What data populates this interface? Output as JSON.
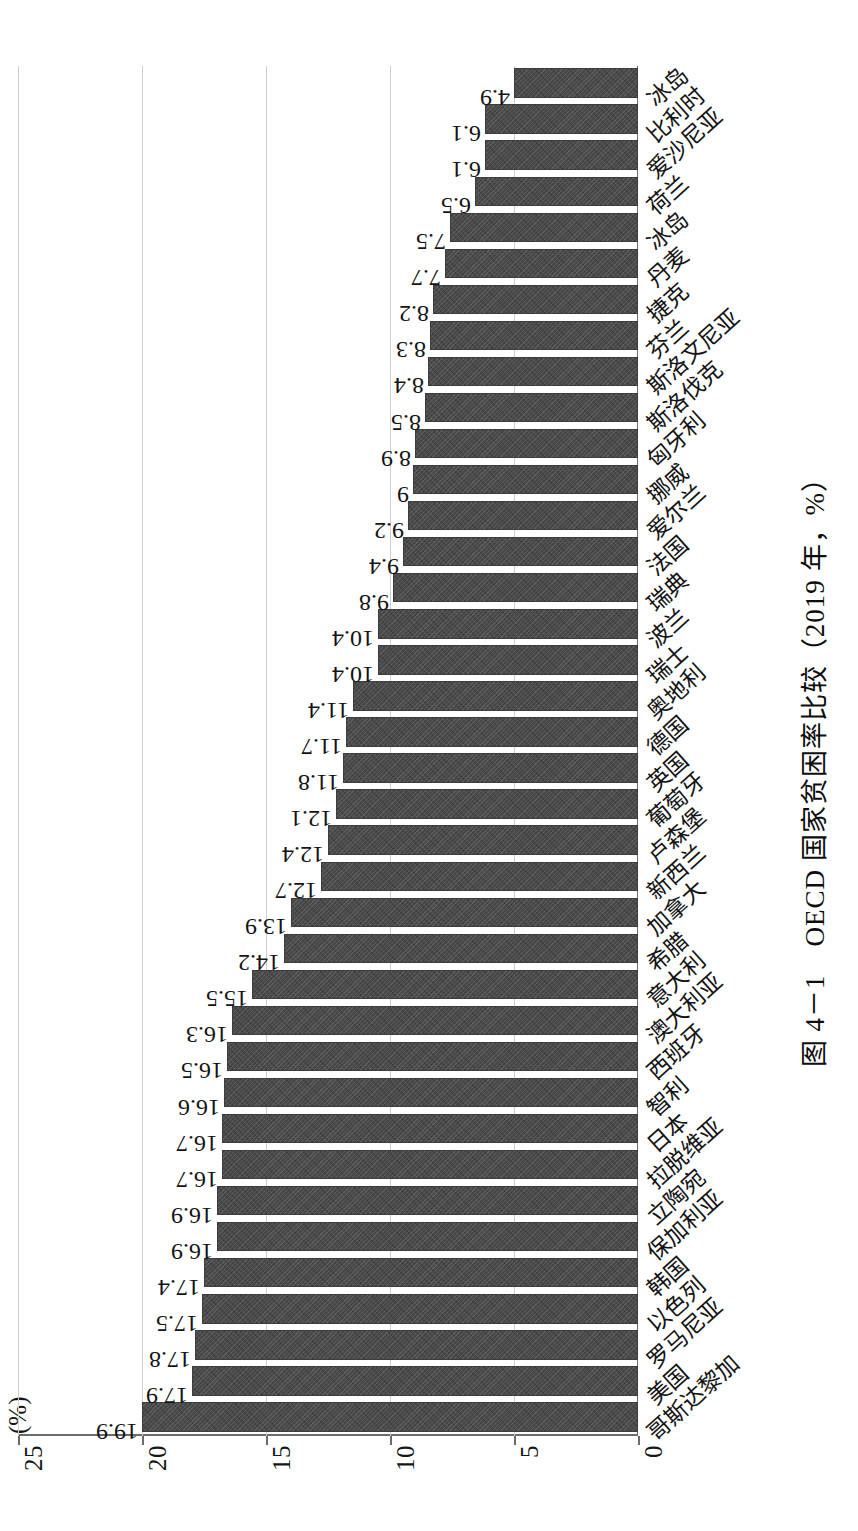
{
  "figure": {
    "caption": "图 4－1　OECD 国家贫困率比较（2019 年，%）",
    "unit_label": "(%)"
  },
  "axis": {
    "y_ticks": [
      "0",
      "5",
      "10",
      "15",
      "20",
      "25"
    ],
    "y_min": 0,
    "y_max": 25
  },
  "chart_data": {
    "type": "bar",
    "title": "图 4－1　OECD 国家贫困率比较（2019 年，%）",
    "xlabel": "",
    "ylabel": "(%)",
    "ylim": [
      0,
      25
    ],
    "grid": true,
    "legend": "none",
    "orientation": "vertical-bars-rotated-90ccw",
    "categories": [
      "哥斯达黎加",
      "美国",
      "罗马尼亚",
      "以色列",
      "韩国",
      "保加利亚",
      "立陶宛",
      "拉脱维亚",
      "日本",
      "智利",
      "西班牙",
      "澳大利亚",
      "意大利",
      "希腊",
      "加拿大",
      "新西兰",
      "卢森堡",
      "葡萄牙",
      "英国",
      "德国",
      "奥地利",
      "瑞士",
      "波兰",
      "瑞典",
      "法国",
      "爱尔兰",
      "挪威",
      "匈牙利",
      "斯洛伐克",
      "斯洛文尼亚",
      "芬兰",
      "捷克",
      "丹麦",
      "冰岛"
    ],
    "values": [
      19.9,
      17.9,
      17.8,
      17.5,
      17.4,
      16.9,
      16.9,
      16.7,
      16.7,
      16.6,
      16.5,
      16.3,
      15.5,
      14.2,
      13.9,
      12.7,
      12.4,
      12.1,
      11.8,
      11.7,
      11.4,
      10.4,
      10.4,
      9.8,
      9.4,
      9.2,
      9,
      8.9,
      8.5,
      8.4,
      8.3,
      8.2,
      7.7,
      7.5
    ],
    "value_labels": [
      "19.9",
      "17.9",
      "17.8",
      "17.5",
      "17.4",
      "16.9",
      "16.9",
      "16.7",
      "16.7",
      "16.6",
      "16.5",
      "16.3",
      "15.5",
      "14.2",
      "13.9",
      "12.7",
      "12.4",
      "12.1",
      "11.8",
      "11.7",
      "11.4",
      "10.4",
      "10.4",
      "9.8",
      "9.4",
      "9.2",
      "9",
      "8.9",
      "8.5",
      "8.4",
      "8.3",
      "8.2",
      "7.7",
      "7.5"
    ],
    "extra_categories": [
      "土耳其",
      "爱沙尼亚",
      "墨西哥"
    ],
    "bar_color": "#4a4a4a",
    "grid_color": "#cfcfcf"
  },
  "trailing_bars": {
    "values": [
      6.5,
      6.1,
      6.1,
      4.9
    ],
    "labels": [
      "6.5",
      "6.1",
      "6.1",
      "4.9"
    ],
    "categories": [
      "荷兰",
      "爱沙尼亚",
      "比利时",
      "冰岛"
    ]
  }
}
